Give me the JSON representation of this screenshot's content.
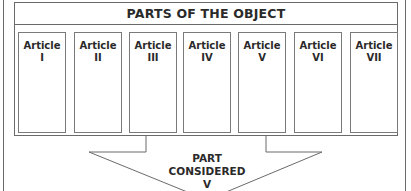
{
  "diagram": {
    "title": "PARTS OF THE OBJECT",
    "articles": [
      {
        "label": "Article",
        "numeral": "I"
      },
      {
        "label": "Article",
        "numeral": "II"
      },
      {
        "label": "Article",
        "numeral": "III"
      },
      {
        "label": "Article",
        "numeral": "IV"
      },
      {
        "label": "Article",
        "numeral": "V"
      },
      {
        "label": "Article",
        "numeral": "VI"
      },
      {
        "label": "Article",
        "numeral": "VII"
      }
    ],
    "arrow": {
      "line1": "PART",
      "line2": "CONSIDERED",
      "line3": "V"
    },
    "colors": {
      "line": "#6a6a6a",
      "text": "#2a2a2a",
      "background": "#ffffff"
    }
  }
}
